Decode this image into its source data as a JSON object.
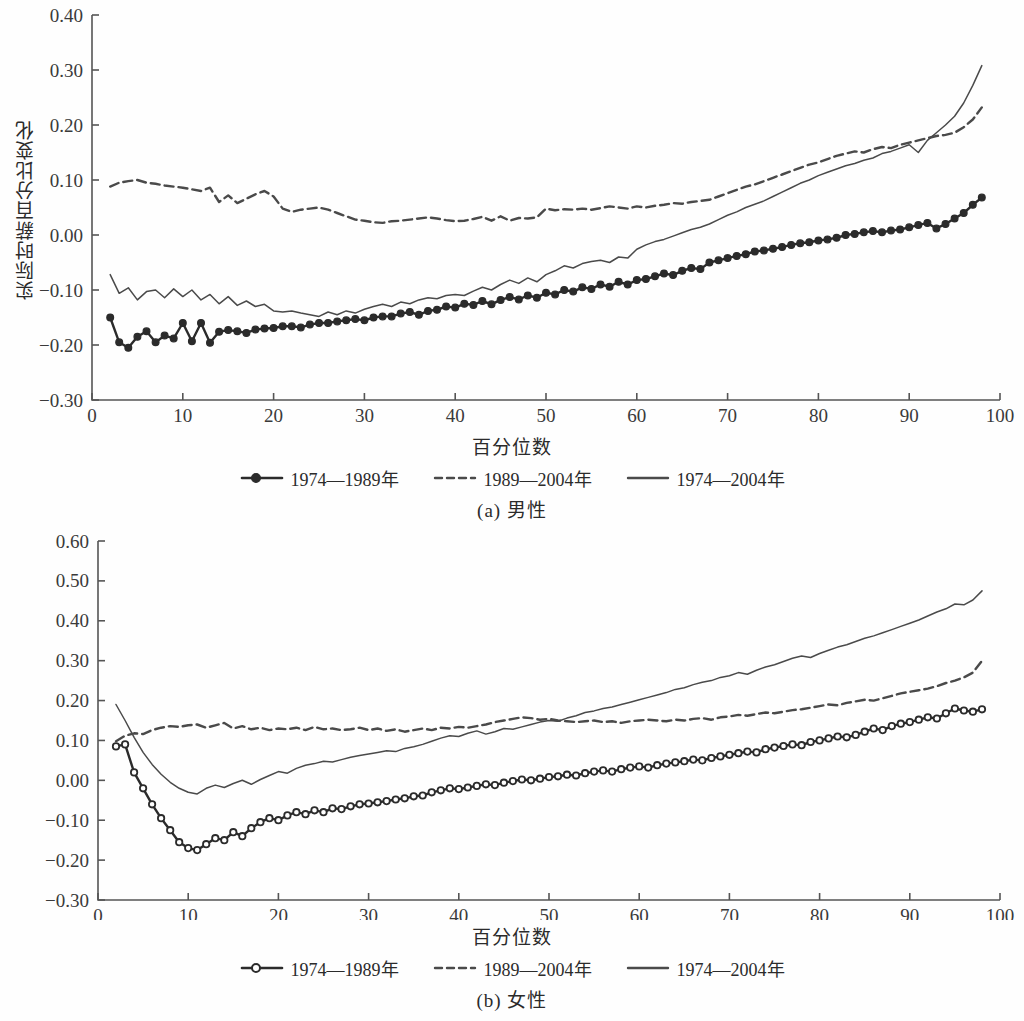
{
  "figures": [
    {
      "id": "a",
      "caption": "(a) 男性",
      "axis_x_title": "百分位数",
      "axis_y_title": "实际时薪百分比变化",
      "legend": [
        {
          "label": "1974—1989年",
          "style": "solid-marker-filled"
        },
        {
          "label": "1989—2004年",
          "style": "dashed"
        },
        {
          "label": "1974—2004年",
          "style": "solid"
        }
      ]
    },
    {
      "id": "b",
      "caption": "(b) 女性",
      "axis_x_title": "百分位数",
      "axis_y_title": "实际时薪百分比变化",
      "legend": [
        {
          "label": "1974—1989年",
          "style": "solid-marker-open"
        },
        {
          "label": "1989—2004年",
          "style": "dashed"
        },
        {
          "label": "1974—2004年",
          "style": "solid"
        }
      ]
    }
  ],
  "colors": {
    "line": "#4a4a4a",
    "line_dark": "#2b2b2b",
    "axis": "#555555",
    "background": "#ffffff",
    "marker_fill_open": "#ffffff"
  },
  "chart_data": [
    {
      "type": "line",
      "panel": "a",
      "title": "(a) 男性",
      "xlabel": "百分位数",
      "ylabel": "实际时薪百分比变化",
      "xlim": [
        0,
        100
      ],
      "ylim": [
        -0.3,
        0.4
      ],
      "xticks": [
        0,
        10,
        20,
        30,
        40,
        50,
        60,
        70,
        80,
        90,
        100
      ],
      "yticks": [
        -0.3,
        -0.2,
        -0.1,
        0.0,
        0.1,
        0.2,
        0.3,
        0.4
      ],
      "ytick_labels": [
        "-0.30",
        "-0.20",
        "-0.10",
        "0.00",
        "0.10",
        "0.20",
        "0.30",
        "0.40"
      ],
      "xtick_labels": [
        "0",
        "10",
        "20",
        "30",
        "40",
        "50",
        "60",
        "70",
        "80",
        "90",
        "100"
      ],
      "grid": false,
      "legend_position": "below",
      "x": [
        2,
        3,
        4,
        5,
        6,
        7,
        8,
        9,
        10,
        11,
        12,
        13,
        14,
        15,
        16,
        17,
        18,
        19,
        20,
        21,
        22,
        23,
        24,
        25,
        26,
        27,
        28,
        29,
        30,
        31,
        32,
        33,
        34,
        35,
        36,
        37,
        38,
        39,
        40,
        41,
        42,
        43,
        44,
        45,
        46,
        47,
        48,
        49,
        50,
        51,
        52,
        53,
        54,
        55,
        56,
        57,
        58,
        59,
        60,
        61,
        62,
        63,
        64,
        65,
        66,
        67,
        68,
        69,
        70,
        71,
        72,
        73,
        74,
        75,
        76,
        77,
        78,
        79,
        80,
        81,
        82,
        83,
        84,
        85,
        86,
        87,
        88,
        89,
        90,
        91,
        92,
        93,
        94,
        95,
        96,
        97,
        98
      ],
      "series": [
        {
          "name": "1974—1989年",
          "style": "solid-marker-filled",
          "values": [
            -0.15,
            -0.195,
            -0.205,
            -0.185,
            -0.175,
            -0.195,
            -0.183,
            -0.188,
            -0.16,
            -0.193,
            -0.16,
            -0.196,
            -0.176,
            -0.173,
            -0.175,
            -0.178,
            -0.172,
            -0.17,
            -0.169,
            -0.166,
            -0.166,
            -0.168,
            -0.163,
            -0.16,
            -0.16,
            -0.157,
            -0.155,
            -0.153,
            -0.155,
            -0.15,
            -0.148,
            -0.148,
            -0.143,
            -0.14,
            -0.145,
            -0.138,
            -0.136,
            -0.13,
            -0.132,
            -0.125,
            -0.127,
            -0.12,
            -0.126,
            -0.118,
            -0.113,
            -0.117,
            -0.11,
            -0.114,
            -0.105,
            -0.108,
            -0.1,
            -0.103,
            -0.095,
            -0.098,
            -0.09,
            -0.094,
            -0.085,
            -0.09,
            -0.082,
            -0.08,
            -0.075,
            -0.07,
            -0.073,
            -0.065,
            -0.06,
            -0.062,
            -0.05,
            -0.046,
            -0.042,
            -0.038,
            -0.035,
            -0.03,
            -0.028,
            -0.025,
            -0.022,
            -0.018,
            -0.015,
            -0.013,
            -0.01,
            -0.008,
            -0.005,
            0.0,
            0.002,
            0.005,
            0.007,
            0.005,
            0.008,
            0.01,
            0.014,
            0.018,
            0.022,
            0.012,
            0.02,
            0.03,
            0.04,
            0.055,
            0.068,
            0.07
          ]
        },
        {
          "name": "1989—2004年",
          "style": "dashed",
          "values": [
            0.088,
            0.095,
            0.098,
            0.1,
            0.095,
            0.093,
            0.09,
            0.088,
            0.086,
            0.083,
            0.08,
            0.086,
            0.06,
            0.072,
            0.058,
            0.066,
            0.074,
            0.08,
            0.07,
            0.048,
            0.042,
            0.046,
            0.048,
            0.05,
            0.046,
            0.04,
            0.034,
            0.028,
            0.026,
            0.023,
            0.022,
            0.025,
            0.026,
            0.028,
            0.03,
            0.032,
            0.03,
            0.027,
            0.025,
            0.026,
            0.029,
            0.033,
            0.026,
            0.034,
            0.026,
            0.031,
            0.03,
            0.032,
            0.048,
            0.045,
            0.047,
            0.046,
            0.048,
            0.046,
            0.049,
            0.052,
            0.05,
            0.048,
            0.052,
            0.05,
            0.053,
            0.055,
            0.058,
            0.057,
            0.06,
            0.062,
            0.064,
            0.07,
            0.076,
            0.082,
            0.088,
            0.092,
            0.098,
            0.104,
            0.11,
            0.116,
            0.122,
            0.128,
            0.132,
            0.138,
            0.144,
            0.148,
            0.152,
            0.15,
            0.156,
            0.16,
            0.158,
            0.164,
            0.168,
            0.172,
            0.176,
            0.18,
            0.182,
            0.186,
            0.196,
            0.21,
            0.232
          ]
        },
        {
          "name": "1974—2004年",
          "style": "solid",
          "values": [
            -0.072,
            -0.106,
            -0.096,
            -0.118,
            -0.103,
            -0.1,
            -0.114,
            -0.098,
            -0.112,
            -0.1,
            -0.118,
            -0.108,
            -0.125,
            -0.112,
            -0.128,
            -0.12,
            -0.13,
            -0.126,
            -0.138,
            -0.14,
            -0.138,
            -0.142,
            -0.145,
            -0.148,
            -0.14,
            -0.145,
            -0.138,
            -0.142,
            -0.135,
            -0.13,
            -0.126,
            -0.13,
            -0.122,
            -0.125,
            -0.118,
            -0.114,
            -0.116,
            -0.11,
            -0.108,
            -0.11,
            -0.102,
            -0.095,
            -0.1,
            -0.09,
            -0.082,
            -0.088,
            -0.078,
            -0.085,
            -0.072,
            -0.065,
            -0.056,
            -0.06,
            -0.052,
            -0.048,
            -0.046,
            -0.05,
            -0.04,
            -0.042,
            -0.026,
            -0.018,
            -0.012,
            -0.008,
            -0.002,
            0.004,
            0.01,
            0.014,
            0.02,
            0.028,
            0.036,
            0.042,
            0.05,
            0.056,
            0.062,
            0.07,
            0.078,
            0.086,
            0.094,
            0.1,
            0.108,
            0.114,
            0.12,
            0.126,
            0.13,
            0.136,
            0.14,
            0.148,
            0.152,
            0.158,
            0.164,
            0.15,
            0.172,
            0.186,
            0.2,
            0.216,
            0.24,
            0.272,
            0.308
          ]
        }
      ]
    },
    {
      "type": "line",
      "panel": "b",
      "title": "(b) 女性",
      "xlabel": "百分位数",
      "ylabel": "实际时薪百分比变化",
      "xlim": [
        0,
        100
      ],
      "ylim": [
        -0.3,
        0.6
      ],
      "xticks": [
        0,
        10,
        20,
        30,
        40,
        50,
        60,
        70,
        80,
        90,
        100
      ],
      "yticks": [
        -0.3,
        -0.2,
        -0.1,
        0.0,
        0.1,
        0.2,
        0.3,
        0.4,
        0.5,
        0.6
      ],
      "ytick_labels": [
        "-0.30",
        "-0.20",
        "-0.10",
        "0.00",
        "0.10",
        "0.20",
        "0.30",
        "0.40",
        "0.50",
        "0.60"
      ],
      "xtick_labels": [
        "0",
        "10",
        "20",
        "30",
        "40",
        "50",
        "60",
        "70",
        "80",
        "90",
        "100"
      ],
      "grid": false,
      "legend_position": "below",
      "x": [
        2,
        3,
        4,
        5,
        6,
        7,
        8,
        9,
        10,
        11,
        12,
        13,
        14,
        15,
        16,
        17,
        18,
        19,
        20,
        21,
        22,
        23,
        24,
        25,
        26,
        27,
        28,
        29,
        30,
        31,
        32,
        33,
        34,
        35,
        36,
        37,
        38,
        39,
        40,
        41,
        42,
        43,
        44,
        45,
        46,
        47,
        48,
        49,
        50,
        51,
        52,
        53,
        54,
        55,
        56,
        57,
        58,
        59,
        60,
        61,
        62,
        63,
        64,
        65,
        66,
        67,
        68,
        69,
        70,
        71,
        72,
        73,
        74,
        75,
        76,
        77,
        78,
        79,
        80,
        81,
        82,
        83,
        84,
        85,
        86,
        87,
        88,
        89,
        90,
        91,
        92,
        93,
        94,
        95,
        96,
        97,
        98
      ],
      "series": [
        {
          "name": "1974—1989年",
          "style": "solid-marker-open",
          "values": [
            0.085,
            0.09,
            0.02,
            -0.02,
            -0.06,
            -0.095,
            -0.125,
            -0.155,
            -0.17,
            -0.175,
            -0.16,
            -0.145,
            -0.15,
            -0.13,
            -0.14,
            -0.12,
            -0.105,
            -0.095,
            -0.1,
            -0.088,
            -0.08,
            -0.085,
            -0.075,
            -0.08,
            -0.07,
            -0.072,
            -0.065,
            -0.06,
            -0.058,
            -0.055,
            -0.052,
            -0.048,
            -0.045,
            -0.04,
            -0.038,
            -0.03,
            -0.025,
            -0.02,
            -0.022,
            -0.018,
            -0.014,
            -0.01,
            -0.012,
            -0.006,
            -0.002,
            0.002,
            0.0,
            0.004,
            0.008,
            0.01,
            0.014,
            0.012,
            0.018,
            0.022,
            0.025,
            0.022,
            0.028,
            0.032,
            0.035,
            0.032,
            0.038,
            0.042,
            0.045,
            0.048,
            0.052,
            0.05,
            0.056,
            0.06,
            0.064,
            0.068,
            0.072,
            0.07,
            0.078,
            0.082,
            0.086,
            0.09,
            0.088,
            0.096,
            0.1,
            0.105,
            0.11,
            0.108,
            0.114,
            0.122,
            0.13,
            0.126,
            0.136,
            0.142,
            0.146,
            0.152,
            0.158,
            0.155,
            0.168,
            0.18,
            0.175,
            0.172,
            0.178
          ]
        },
        {
          "name": "1989—2004年",
          "style": "dashed",
          "values": [
            0.098,
            0.112,
            0.118,
            0.116,
            0.126,
            0.132,
            0.136,
            0.134,
            0.138,
            0.14,
            0.132,
            0.138,
            0.144,
            0.13,
            0.136,
            0.128,
            0.132,
            0.126,
            0.13,
            0.128,
            0.132,
            0.126,
            0.134,
            0.128,
            0.13,
            0.126,
            0.128,
            0.132,
            0.126,
            0.13,
            0.124,
            0.128,
            0.122,
            0.126,
            0.13,
            0.126,
            0.132,
            0.13,
            0.134,
            0.132,
            0.136,
            0.14,
            0.146,
            0.15,
            0.154,
            0.158,
            0.156,
            0.152,
            0.154,
            0.15,
            0.148,
            0.146,
            0.148,
            0.15,
            0.146,
            0.148,
            0.144,
            0.148,
            0.15,
            0.152,
            0.15,
            0.148,
            0.152,
            0.15,
            0.154,
            0.156,
            0.152,
            0.158,
            0.16,
            0.164,
            0.162,
            0.166,
            0.17,
            0.168,
            0.172,
            0.176,
            0.178,
            0.182,
            0.186,
            0.19,
            0.188,
            0.194,
            0.198,
            0.202,
            0.2,
            0.206,
            0.212,
            0.218,
            0.222,
            0.226,
            0.23,
            0.236,
            0.244,
            0.25,
            0.258,
            0.27,
            0.3
          ]
        },
        {
          "name": "1974—2004年",
          "style": "solid",
          "values": [
            0.19,
            0.15,
            0.108,
            0.07,
            0.04,
            0.015,
            -0.005,
            -0.02,
            -0.03,
            -0.034,
            -0.02,
            -0.012,
            -0.018,
            -0.008,
            0.0,
            -0.01,
            0.002,
            0.012,
            0.022,
            0.018,
            0.03,
            0.038,
            0.042,
            0.048,
            0.046,
            0.052,
            0.058,
            0.062,
            0.066,
            0.07,
            0.074,
            0.072,
            0.08,
            0.084,
            0.09,
            0.098,
            0.106,
            0.112,
            0.11,
            0.118,
            0.124,
            0.116,
            0.122,
            0.13,
            0.128,
            0.134,
            0.14,
            0.146,
            0.15,
            0.148,
            0.156,
            0.162,
            0.17,
            0.174,
            0.18,
            0.184,
            0.19,
            0.196,
            0.202,
            0.208,
            0.214,
            0.22,
            0.228,
            0.232,
            0.24,
            0.246,
            0.25,
            0.258,
            0.262,
            0.27,
            0.266,
            0.276,
            0.284,
            0.29,
            0.298,
            0.306,
            0.312,
            0.308,
            0.318,
            0.326,
            0.334,
            0.34,
            0.348,
            0.356,
            0.362,
            0.37,
            0.378,
            0.386,
            0.394,
            0.402,
            0.412,
            0.422,
            0.43,
            0.442,
            0.44,
            0.452,
            0.475
          ]
        }
      ]
    }
  ]
}
